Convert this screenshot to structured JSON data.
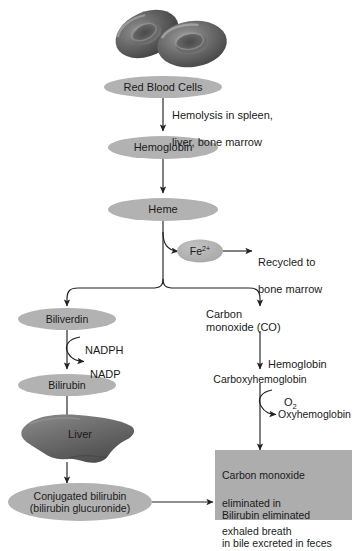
{
  "diagram": {
    "colors": {
      "ellipse_fill": "#b2b2b2",
      "box_fill": "#adadad",
      "line": "#222222",
      "rbc_dark": "#555555",
      "liver_fill": "#6e6e6e",
      "text": "#1a1a1a"
    }
  },
  "nodes": {
    "rbc_image": "red-blood-cells-illustration",
    "red_blood_cells": "Red Blood Cells",
    "hemoglobin": "Hemoglobin",
    "heme": "Heme",
    "iron": "Fe",
    "iron_charge": "2+",
    "biliverdin": "Biliverdin",
    "bilirubin": "Bilirubin",
    "liver": "Liver",
    "conjugated_bilirubin_line1": "Conjugated bilirubin",
    "conjugated_bilirubin_line2": "(bilirubin glucuronide)",
    "carbon_monoxide_line1": "Carbon",
    "carbon_monoxide_line2": "monoxide (CO)",
    "carboxyhemoglobin": "Carboxyhemoglobin",
    "oxyhemoglobin": "Oxyhemoglobin"
  },
  "edge_labels": {
    "hemolysis_line1": "Hemolysis in spleen,",
    "hemolysis_line2": "liver, bone marrow",
    "recycled_line1": "Recycled to",
    "recycled_line2": "bone marrow",
    "nadph": "NADPH",
    "nadp": "NADP",
    "hemoglobin_cofactor": "Hemoglobin",
    "oxygen": "O",
    "oxygen_sub": "2"
  },
  "outcome_box": {
    "co_line1": "Carbon monoxide",
    "co_line2": "eliminated in",
    "co_line3": "exhaled breath",
    "bili_line1": "Bilirubin eliminated",
    "bili_line2": "in bile excreted in feces"
  }
}
